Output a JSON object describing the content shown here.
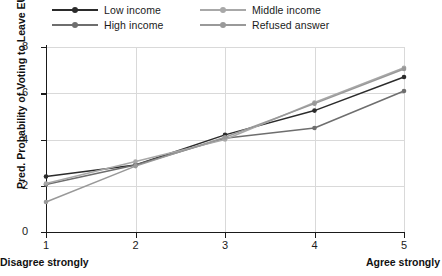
{
  "chart_data": {
    "type": "line",
    "title": "",
    "subtitle": "",
    "xlabel": "",
    "ylabel": "Pred. Probability of Voting to Leave EU",
    "x": [
      1,
      2,
      3,
      4,
      5
    ],
    "categories": [
      "1",
      "2",
      "3",
      "4",
      "5"
    ],
    "xtick_labels": [
      "1",
      "2",
      "3",
      "4",
      "5"
    ],
    "ytick_labels": [
      "0",
      "2",
      "4",
      "6",
      "8"
    ],
    "yticks": [
      0,
      2,
      4,
      6,
      8
    ],
    "xlim": [
      1,
      5
    ],
    "ylim": [
      0,
      8
    ],
    "grid": true,
    "legend_position": "top",
    "x_axis_left_annotation": "Disagree strongly",
    "x_axis_right_annotation": "Agree strongly",
    "series": [
      {
        "name": "Low income",
        "color": "#2b2b2b",
        "values": [
          2.4,
          2.9,
          4.2,
          5.25,
          6.7
        ]
      },
      {
        "name": "High income",
        "color": "#6e6e6e",
        "values": [
          2.05,
          2.9,
          4.05,
          4.5,
          6.1
        ]
      },
      {
        "name": "Middle income",
        "color": "#a8a8a8",
        "values": [
          2.1,
          3.05,
          4.0,
          5.6,
          7.1
        ]
      },
      {
        "name": "Refused answer",
        "color": "#999999",
        "values": [
          1.3,
          2.85,
          4.1,
          5.55,
          7.05
        ]
      }
    ]
  },
  "legend": {
    "entries": [
      {
        "label": "Low income",
        "color": "#2b2b2b"
      },
      {
        "label": "Middle income",
        "color": "#a8a8a8"
      },
      {
        "label": "High income",
        "color": "#6e6e6e"
      },
      {
        "label": "Refused answer",
        "color": "#999999"
      }
    ]
  },
  "axes": {
    "ylabel": "Pred. Probability of Voting to Leave EU",
    "ytick_labels": [
      "8",
      "6",
      "4",
      "2",
      "0"
    ],
    "xtick_labels": [
      "1",
      "2",
      "3",
      "4",
      "5"
    ],
    "left_annotation": "Disagree strongly",
    "right_annotation": "Agree strongly"
  },
  "colors": {
    "axis": "#1a1a1a",
    "grid": "#d9d9d9",
    "background": "#ffffff"
  }
}
